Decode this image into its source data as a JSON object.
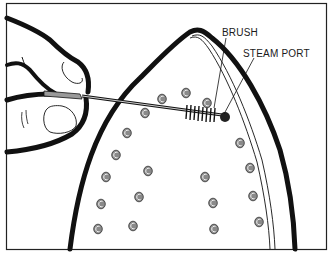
{
  "figure": {
    "labels": {
      "brush": "BRUSH",
      "steam_port": "STEAM PORT"
    },
    "colors": {
      "outline": "#111111",
      "port_fill": "#8a8a8a",
      "handle_grip": "#9a9a9a",
      "background": "#ffffff"
    },
    "steam_ports": [
      [
        186,
        93
      ],
      [
        162,
        99
      ],
      [
        207,
        103
      ],
      [
        145,
        113
      ],
      [
        127,
        133
      ],
      [
        116,
        155
      ],
      [
        240,
        143
      ],
      [
        106,
        177
      ],
      [
        148,
        171
      ],
      [
        250,
        168
      ],
      [
        101,
        204
      ],
      [
        139,
        197
      ],
      [
        205,
        177
      ],
      [
        253,
        196
      ],
      [
        98,
        229
      ],
      [
        133,
        226
      ],
      [
        213,
        203
      ],
      [
        259,
        222
      ],
      [
        214,
        229
      ]
    ]
  }
}
